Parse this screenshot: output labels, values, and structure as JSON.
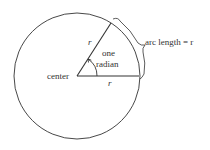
{
  "diagram": {
    "title": "",
    "labels": {
      "center": "center",
      "radius_slanted": "r",
      "radius_horizontal": "r",
      "angle_line1": "one",
      "angle_line2": "radian",
      "arc": "arc length = r"
    },
    "colors": {
      "stroke": "#333333",
      "background": "#ffffff"
    }
  }
}
